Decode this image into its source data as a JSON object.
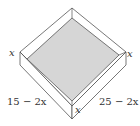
{
  "diagram": {
    "type": "open-box-from-folded-sheet",
    "labels": {
      "left_height": "x",
      "right_height": "x",
      "bottom_height": "x",
      "left_side": "15 − 2x",
      "right_side": "25 − 2x"
    },
    "colors": {
      "base_fill": "#d6d6d6",
      "wall_fill": "#ffffff",
      "stroke": "#555555"
    }
  }
}
